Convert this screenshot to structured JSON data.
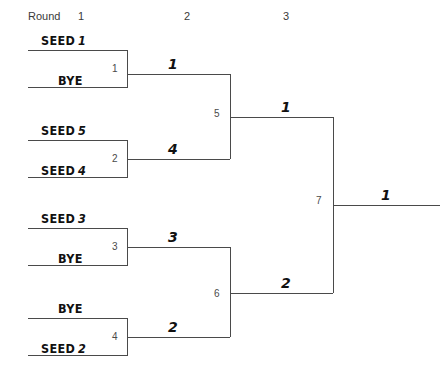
{
  "header": {
    "round_word": "Round",
    "round_numbers": [
      "1",
      "2",
      "3"
    ]
  },
  "bracket": {
    "round1": [
      {
        "match_number": "1",
        "top_label": "SEED",
        "top_seed": "1",
        "bottom_label": "BYE",
        "bottom_seed": "",
        "winner": "1"
      },
      {
        "match_number": "2",
        "top_label": "SEED",
        "top_seed": "5",
        "bottom_label": "SEED",
        "bottom_seed": "4",
        "winner": "4"
      },
      {
        "match_number": "3",
        "top_label": "SEED",
        "top_seed": "3",
        "bottom_label": "BYE",
        "bottom_seed": "",
        "winner": "3"
      },
      {
        "match_number": "4",
        "top_label": "BYE",
        "top_seed": "",
        "bottom_label": "SEED",
        "bottom_seed": "2",
        "winner": "2"
      }
    ],
    "round2": [
      {
        "match_number": "5",
        "winner": "1"
      },
      {
        "match_number": "6",
        "winner": "2"
      }
    ],
    "round3": [
      {
        "match_number": "7",
        "winner": "1"
      }
    ],
    "champion": "1"
  },
  "colors": {
    "line": "#4a4a4a",
    "text": "#111111",
    "muted": "#3a3a3a",
    "background": "#ffffff"
  }
}
